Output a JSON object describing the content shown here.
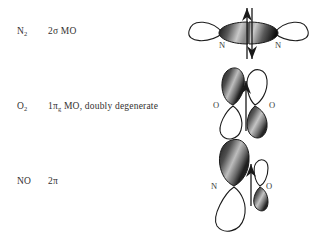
{
  "figure": {
    "background_color": "#ffffff",
    "ink_color": "#2b2b2b",
    "lobe_shaded_color": "#4a4a4a",
    "lobe_empty_color": "#ffffff"
  },
  "rows": [
    {
      "formula": "N",
      "formula_sub": "2",
      "description_pre": "2",
      "description_greek": "σ",
      "description_post": " MO",
      "description_full": "2σ MO",
      "diagram": {
        "kind": "sigma-mo",
        "orientation": "horizontal",
        "atom_left_label": "N",
        "atom_right_label": "N",
        "electron_arrows": [
          "up",
          "down"
        ],
        "electron_count": 2
      }
    },
    {
      "formula": "O",
      "formula_sub": "2",
      "description_pre": "1",
      "description_greek": "π",
      "description_greek_sub": "g",
      "description_post": " MO, doubly degenerate",
      "description_full": "1πg MO, doubly degenerate",
      "diagram": {
        "kind": "pi-antibonding-mo",
        "orientation": "vertical",
        "atom_left_label": "O",
        "atom_right_label": "O",
        "electron_arrows": [
          "up"
        ],
        "electron_count": 1
      }
    },
    {
      "formula": "NO",
      "formula_sub": "",
      "description_pre": "2",
      "description_greek": "π",
      "description_post": "",
      "description_full": "2π",
      "diagram": {
        "kind": "pi-mo-heteronuclear",
        "orientation": "vertical",
        "atom_left_label": "N",
        "atom_right_label": "O",
        "electron_arrows": [
          "up"
        ],
        "electron_count": 1
      }
    }
  ]
}
